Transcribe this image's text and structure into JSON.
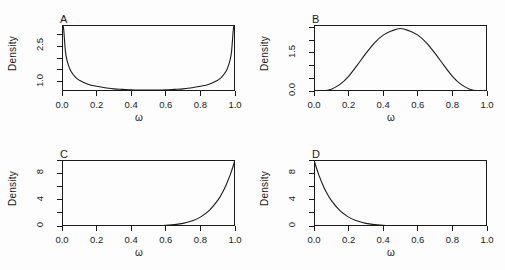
{
  "figure": {
    "width": 505,
    "height": 270,
    "background": "#fdfdfd",
    "line_color": "#1a1a1a",
    "layout": "2x2 grid of density panels"
  },
  "chart_data": [
    {
      "type": "line",
      "panel": "A",
      "title": "A",
      "xlabel": "ω",
      "ylabel": "Density",
      "distribution": "Beta(0.5, 0.5)",
      "xlim": [
        0.0,
        1.0
      ],
      "ylim": [
        0.6,
        3.4
      ],
      "xticks": [
        0.0,
        0.2,
        0.4,
        0.6,
        0.8,
        1.0
      ],
      "xtick_labels": [
        "0.0",
        "0.2",
        "0.4",
        "0.6",
        "0.8",
        "1.0"
      ],
      "yticks": [
        1.0,
        2.5
      ],
      "ytick_labels": [
        "1.0",
        "2.5"
      ],
      "ytick_minor": [
        1.5,
        2.0,
        3.0
      ],
      "grid": false,
      "legend": "none",
      "x": [
        0.005,
        0.01,
        0.02,
        0.03,
        0.05,
        0.08,
        0.1,
        0.15,
        0.2,
        0.25,
        0.3,
        0.35,
        0.4,
        0.45,
        0.5,
        0.55,
        0.6,
        0.65,
        0.7,
        0.75,
        0.8,
        0.85,
        0.9,
        0.92,
        0.95,
        0.97,
        0.98,
        0.99,
        0.995
      ],
      "y": [
        4.51,
        3.2,
        2.27,
        1.87,
        1.46,
        1.17,
        1.06,
        0.89,
        0.8,
        0.74,
        0.69,
        0.67,
        0.65,
        0.64,
        0.637,
        0.64,
        0.65,
        0.67,
        0.69,
        0.74,
        0.8,
        0.89,
        1.06,
        1.17,
        1.46,
        1.87,
        2.27,
        3.2,
        4.51
      ]
    },
    {
      "type": "line",
      "panel": "B",
      "title": "B",
      "xlabel": "ω",
      "ylabel": "Density",
      "distribution": "Beta(5, 5)",
      "xlim": [
        0.0,
        1.0
      ],
      "ylim": [
        0.0,
        2.6
      ],
      "xticks": [
        0.0,
        0.2,
        0.4,
        0.6,
        0.8,
        1.0
      ],
      "xtick_labels": [
        "0.0",
        "0.2",
        "0.4",
        "0.6",
        "0.8",
        "1.0"
      ],
      "yticks": [
        0.0,
        1.5
      ],
      "ytick_labels": [
        "0.0",
        "1.5"
      ],
      "ytick_minor": [
        0.5,
        1.0,
        2.0,
        2.5
      ],
      "grid": false,
      "legend": "none",
      "x": [
        0.0,
        0.05,
        0.1,
        0.15,
        0.2,
        0.25,
        0.3,
        0.35,
        0.4,
        0.45,
        0.5,
        0.55,
        0.6,
        0.65,
        0.7,
        0.75,
        0.8,
        0.85,
        0.9,
        0.95,
        1.0
      ],
      "y": [
        0.0,
        0.0064,
        0.073,
        0.26,
        0.58,
        1.02,
        1.48,
        1.9,
        2.2,
        2.37,
        2.46,
        2.37,
        2.2,
        1.9,
        1.48,
        1.02,
        0.58,
        0.26,
        0.073,
        0.0064,
        0.0
      ]
    },
    {
      "type": "line",
      "panel": "C",
      "title": "C",
      "xlabel": "ω",
      "ylabel": "Density",
      "distribution": "Beta(10, 1)",
      "xlim": [
        0.0,
        1.0
      ],
      "ylim": [
        0.0,
        10.0
      ],
      "xticks": [
        0.0,
        0.2,
        0.4,
        0.6,
        0.8,
        1.0
      ],
      "xtick_labels": [
        "0.0",
        "0.2",
        "0.4",
        "0.6",
        "0.8",
        "1.0"
      ],
      "yticks": [
        0,
        4,
        8
      ],
      "ytick_labels": [
        "0",
        "4",
        "8"
      ],
      "ytick_minor": [
        2,
        6,
        10
      ],
      "grid": false,
      "legend": "none",
      "x": [
        0.0,
        0.1,
        0.2,
        0.3,
        0.4,
        0.5,
        0.6,
        0.7,
        0.75,
        0.8,
        0.85,
        0.9,
        0.93,
        0.95,
        0.97,
        0.98,
        0.99,
        1.0
      ],
      "y": [
        0.0,
        0.0,
        0.0001,
        0.0002,
        0.0026,
        0.0195,
        0.1008,
        0.4035,
        0.7508,
        1.342,
        2.316,
        3.874,
        5.204,
        6.302,
        7.602,
        8.337,
        9.135,
        10.0
      ]
    },
    {
      "type": "line",
      "panel": "D",
      "title": "D",
      "xlabel": "ω",
      "ylabel": "Density",
      "distribution": "Beta(1, 10)",
      "xlim": [
        0.0,
        1.0
      ],
      "ylim": [
        0.0,
        10.0
      ],
      "xticks": [
        0.0,
        0.2,
        0.4,
        0.6,
        0.8,
        1.0
      ],
      "xtick_labels": [
        "0.0",
        "0.2",
        "0.4",
        "0.6",
        "0.8",
        "1.0"
      ],
      "yticks": [
        0,
        4,
        8
      ],
      "ytick_labels": [
        "0",
        "4",
        "8"
      ],
      "ytick_minor": [
        2,
        6,
        10
      ],
      "grid": false,
      "legend": "none",
      "x": [
        0.0,
        0.01,
        0.02,
        0.03,
        0.05,
        0.07,
        0.1,
        0.15,
        0.2,
        0.25,
        0.3,
        0.4,
        0.5,
        0.6,
        0.7,
        0.8,
        0.9,
        1.0
      ],
      "y": [
        10.0,
        9.135,
        8.337,
        7.602,
        6.302,
        5.204,
        3.874,
        2.316,
        1.342,
        0.7508,
        0.4035,
        0.1008,
        0.0195,
        0.0026,
        0.0002,
        0.0001,
        0.0,
        0.0
      ]
    }
  ],
  "panels": {
    "A": {
      "letter": "A",
      "ylabel": "Density",
      "xlabel": "ω",
      "ytick_labels": [
        "1.0",
        "2.5"
      ],
      "xtick_labels": [
        "0.0",
        "0.2",
        "0.4",
        "0.6",
        "0.8",
        "1.0"
      ]
    },
    "B": {
      "letter": "B",
      "ylabel": "Density",
      "xlabel": "ω",
      "ytick_labels": [
        "0.0",
        "1.5"
      ],
      "xtick_labels": [
        "0.0",
        "0.2",
        "0.4",
        "0.6",
        "0.8",
        "1.0"
      ]
    },
    "C": {
      "letter": "C",
      "ylabel": "Density",
      "xlabel": "ω",
      "ytick_labels": [
        "0",
        "4",
        "8"
      ],
      "xtick_labels": [
        "0.0",
        "0.2",
        "0.4",
        "0.6",
        "0.8",
        "1.0"
      ]
    },
    "D": {
      "letter": "D",
      "ylabel": "Density",
      "xlabel": "ω",
      "ytick_labels": [
        "0",
        "4",
        "8"
      ],
      "xtick_labels": [
        "0.0",
        "0.2",
        "0.4",
        "0.6",
        "0.8",
        "1.0"
      ]
    }
  }
}
